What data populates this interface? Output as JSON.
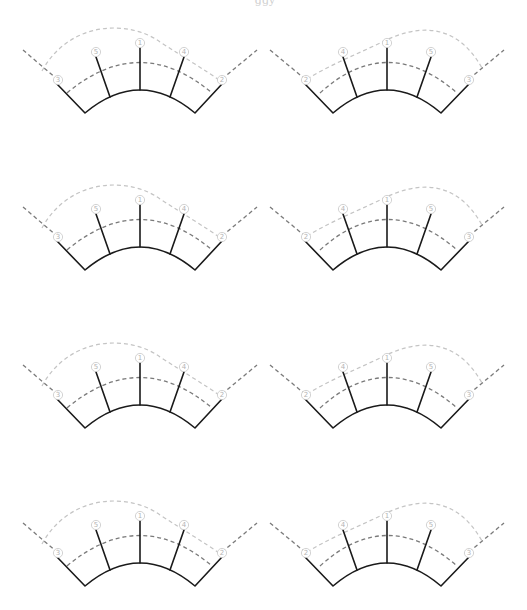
{
  "header": {
    "fragment": "ggy"
  },
  "colors": {
    "solid": "#1a1a1a",
    "dash_dark": "#7a7a7a",
    "dash_light": "#c4c4c4",
    "label": "#b4b4b4"
  },
  "grid": {
    "columns": 2,
    "rows": 4,
    "column_offset_x": 247,
    "row_offsets_y": [
      0,
      157,
      315,
      473
    ]
  },
  "panels": [
    {
      "id": "r1-left",
      "row": 0,
      "variant": "left",
      "labels": [
        "3",
        "5",
        "1",
        "4",
        "2"
      ]
    },
    {
      "id": "r1-right",
      "row": 0,
      "variant": "right",
      "labels": [
        "2",
        "4",
        "1",
        "5",
        "3"
      ]
    },
    {
      "id": "r2-left",
      "row": 1,
      "variant": "left",
      "labels": [
        "3",
        "5",
        "1",
        "4",
        "2"
      ]
    },
    {
      "id": "r2-right",
      "row": 1,
      "variant": "right",
      "labels": [
        "2",
        "4",
        "1",
        "5",
        "3"
      ]
    },
    {
      "id": "r3-left",
      "row": 2,
      "variant": "left",
      "labels": [
        "3",
        "5",
        "1",
        "4",
        "2"
      ]
    },
    {
      "id": "r3-right",
      "row": 2,
      "variant": "right",
      "labels": [
        "2",
        "4",
        "1",
        "5",
        "3"
      ]
    },
    {
      "id": "r4-left",
      "row": 3,
      "variant": "left",
      "labels": [
        "3",
        "5",
        "1",
        "4",
        "2"
      ]
    },
    {
      "id": "r4-right",
      "row": 3,
      "variant": "right",
      "labels": [
        "2",
        "4",
        "1",
        "5",
        "3"
      ]
    }
  ],
  "label_glyphs": {
    "1": "①",
    "2": "②",
    "3": "③",
    "4": "④",
    "5": "⑤"
  }
}
